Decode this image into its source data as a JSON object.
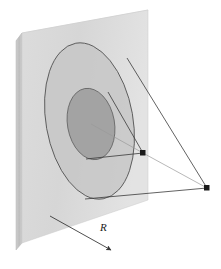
{
  "figure": {
    "kind": "3d-diagram",
    "title": "",
    "labels": {
      "radius": "R"
    },
    "colors": {
      "slab_front": "#d9d9d9",
      "slab_front_light": "#e8e8e8",
      "slab_side": "#c2c2c2",
      "slab_top": "#f2f2f2",
      "outer_zone_fill": "#c6c6c6",
      "inner_zone_fill": "#9e9e9e",
      "zone_outline": "#4a4a4a",
      "ray_line": "#3a3a3a",
      "ray_line_light": "#9a9a9a",
      "point_marker": "#1a1a1a",
      "arrow": "#3a3a3a",
      "background": "#ffffff"
    },
    "slab": {
      "name": "rectangular-plate",
      "front_face": [
        [
          22,
          33
        ],
        [
          148,
          10
        ],
        [
          148,
          200
        ],
        [
          22,
          243
        ]
      ],
      "side_face": [
        [
          22,
          33
        ],
        [
          16,
          41
        ],
        [
          16,
          250
        ],
        [
          22,
          243
        ]
      ],
      "top_face": [
        [
          22,
          33
        ],
        [
          16,
          41
        ],
        [
          142,
          18
        ],
        [
          148,
          10
        ]
      ]
    },
    "zones": {
      "outer": {
        "name": "outer-fresnel-zone",
        "cx": 89.5,
        "cy": 121,
        "rx": 43.5,
        "ry": 79,
        "rotation": -10
      },
      "inner": {
        "name": "inner-fresnel-zone",
        "cx": 91,
        "cy": 124,
        "rx": 23.5,
        "ry": 36,
        "rotation": -10
      }
    },
    "points": [
      {
        "name": "near-source-point",
        "x": 143,
        "y": 153
      },
      {
        "name": "far-source-point",
        "x": 207,
        "y": 188
      }
    ],
    "rays": [
      {
        "name": "ray-center-to-near-point",
        "from": [
          91,
          124
        ],
        "to": [
          143,
          153
        ],
        "shade": "light"
      },
      {
        "name": "ray-inner-top-to-near-point",
        "from": [
          108,
          92
        ],
        "to": [
          143,
          153
        ],
        "shade": "dark"
      },
      {
        "name": "ray-inner-bottom-to-near-point",
        "from": [
          86,
          159
        ],
        "to": [
          143,
          153
        ],
        "shade": "dark"
      },
      {
        "name": "ray-outer-top-to-far-point",
        "from": [
          127,
          58
        ],
        "to": [
          207,
          188
        ],
        "shade": "dark"
      },
      {
        "name": "ray-outer-bottom-to-far-point",
        "from": [
          85,
          199
        ],
        "to": [
          207,
          188
        ],
        "shade": "dark"
      },
      {
        "name": "ray-near-point-to-far-point",
        "from": [
          143,
          153
        ],
        "to": [
          207,
          188
        ],
        "shade": "light"
      }
    ],
    "radius_arrow": {
      "name": "radius-direction-arrow",
      "from": [
        50,
        216
      ],
      "to": [
        113,
        251
      ],
      "label": "R",
      "label_x": 101,
      "label_y": 229
    }
  }
}
